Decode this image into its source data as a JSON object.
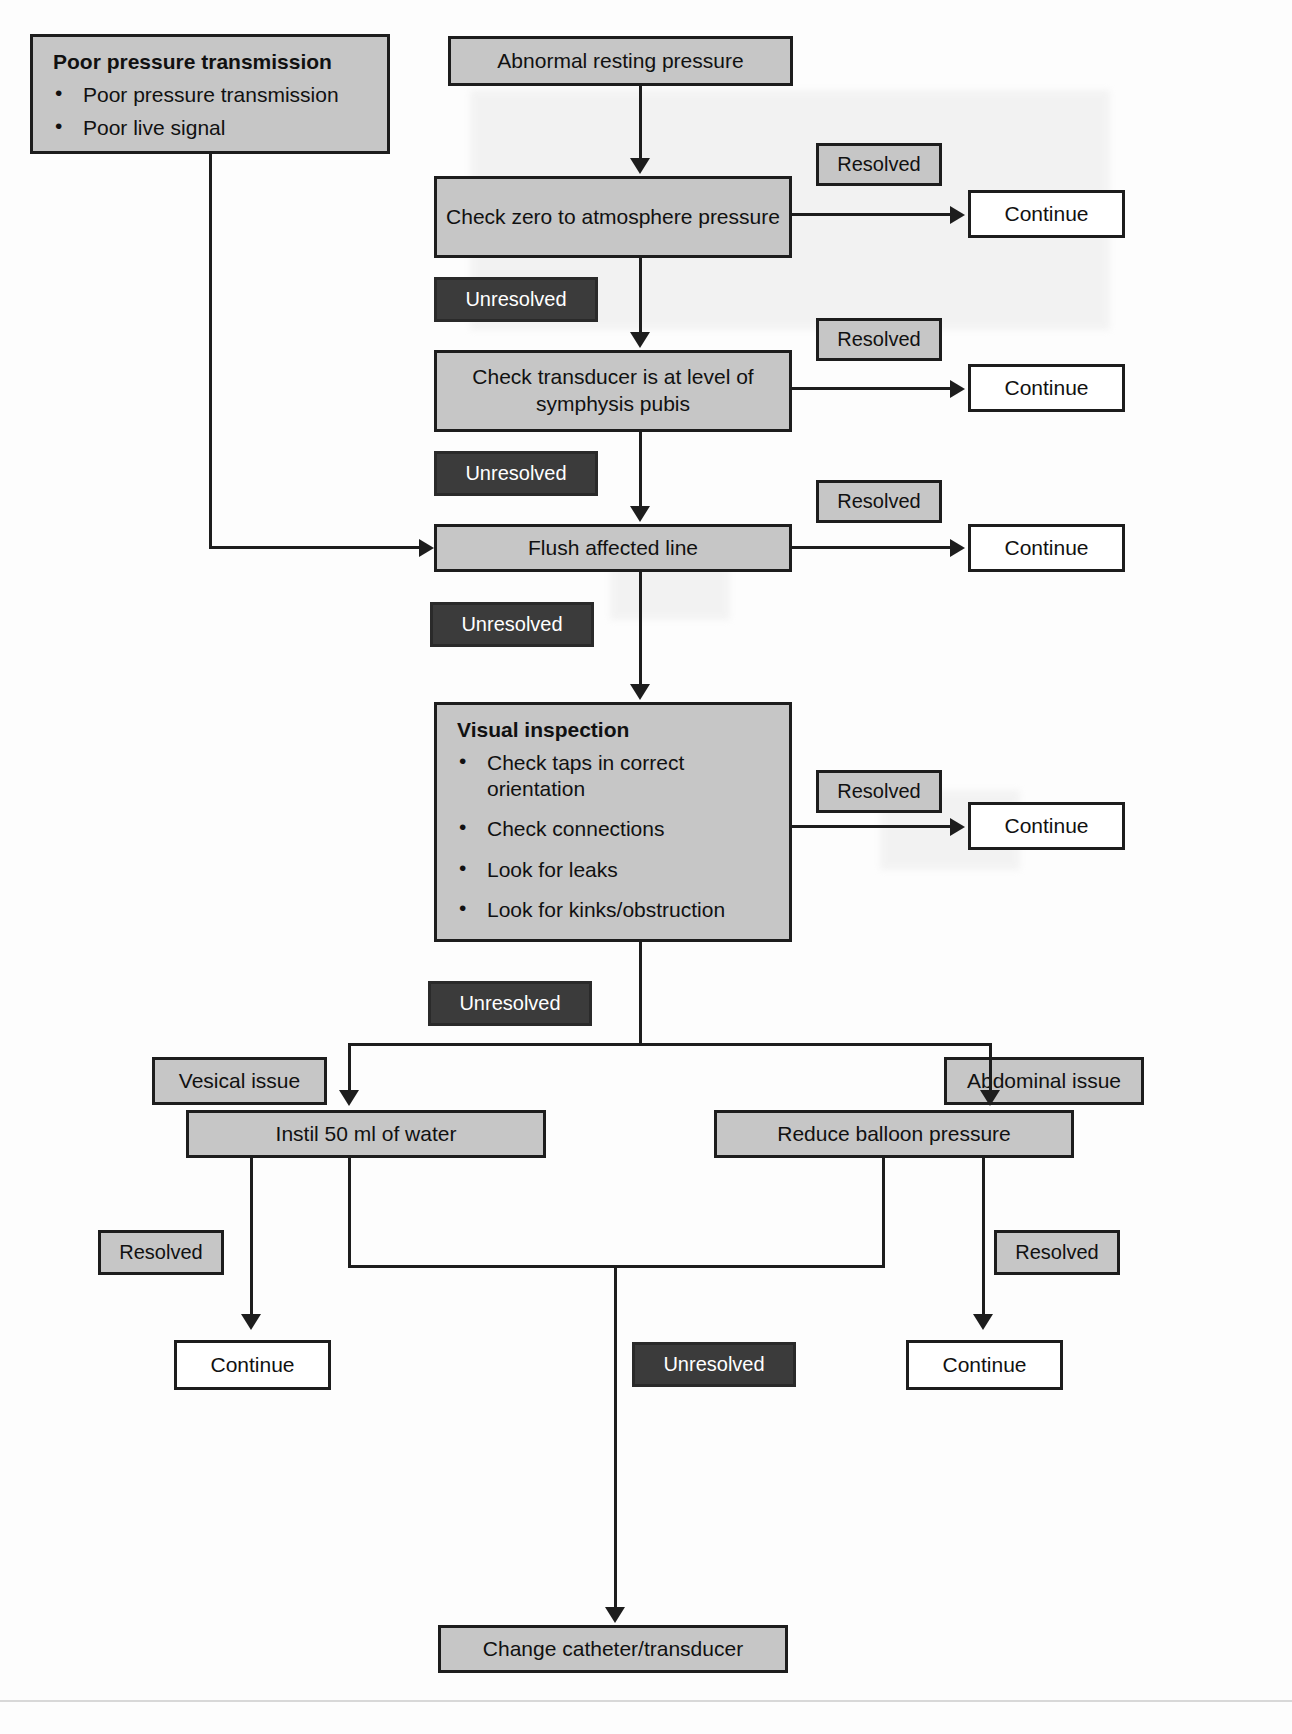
{
  "diagram": {
    "colors": {
      "node_fill": "#c6c6c6",
      "terminal_fill": "#ffffff",
      "unresolved_fill": "#3b3b3b",
      "stroke": "#1d1d1d",
      "page_background": "#fdfdfd"
    },
    "nodes": {
      "poor_transmission": {
        "heading": "Poor pressure transmission",
        "items": [
          "Poor pressure transmission",
          "Poor live signal"
        ]
      },
      "abnormal_resting_pressure": "Abnormal resting pressure",
      "check_zero": "Check zero to atmosphere pressure",
      "check_transducer": "Check transducer is at level of symphysis pubis",
      "flush_line": "Flush affected line",
      "visual_inspection": {
        "heading": "Visual inspection",
        "items": [
          "Check taps in correct orientation",
          "Check connections",
          "Look for leaks",
          "Look for kinks/obstruction"
        ]
      },
      "vesical_issue": "Vesical issue",
      "abdominal_issue": "Abdominal issue",
      "instil_water": "Instil 50 ml of water",
      "reduce_balloon": "Reduce balloon pressure",
      "change_catheter": "Change catheter/transducer"
    },
    "labels": {
      "resolved": "Resolved",
      "unresolved": "Unresolved",
      "continue": "Continue"
    },
    "edge_labels": {
      "resolved_1": "Resolved",
      "resolved_2": "Resolved",
      "resolved_3": "Resolved",
      "resolved_4": "Resolved",
      "resolved_5": "Resolved",
      "resolved_6": "Resolved",
      "unresolved_1": "Unresolved",
      "unresolved_2": "Unresolved",
      "unresolved_3": "Unresolved",
      "unresolved_4": "Unresolved",
      "unresolved_5": "Unresolved"
    },
    "terminals": {
      "continue_1": "Continue",
      "continue_2": "Continue",
      "continue_3": "Continue",
      "continue_4": "Continue",
      "continue_5": "Continue",
      "continue_6": "Continue"
    }
  }
}
